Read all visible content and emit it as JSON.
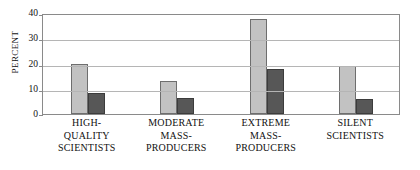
{
  "chart_data": {
    "type": "bar",
    "title": "",
    "xlabel": "",
    "ylabel": "PERCENT",
    "ylim": [
      0,
      40
    ],
    "yticks": [
      0,
      10,
      20,
      30,
      40
    ],
    "ytick_labels": [
      "0",
      "10",
      "20",
      "30",
      "40"
    ],
    "grid": true,
    "grid_axis": "y",
    "legend": false,
    "legend_position": "none",
    "categories": [
      "HIGH-QUALITY SCIENTISTS",
      "MODERATE MASS-PRODUCERS",
      "EXTREME MASS-PRODUCERS",
      "SILENT SCIENTISTS"
    ],
    "category_lines": [
      [
        "HIGH-",
        "QUALITY",
        "SCIENTISTS"
      ],
      [
        "MODERATE",
        "MASS-",
        "PRODUCERS"
      ],
      [
        "EXTREME",
        "MASS-",
        "PRODUCERS"
      ],
      [
        "SILENT",
        "SCIENTISTS"
      ]
    ],
    "series": [
      {
        "name": "series-light",
        "color": "#c2c2c2",
        "values": [
          20.0,
          13.2,
          37.6,
          19.0
        ]
      },
      {
        "name": "series-dark",
        "color": "#575757",
        "values": [
          8.2,
          6.5,
          18.0,
          6.0
        ]
      }
    ]
  }
}
